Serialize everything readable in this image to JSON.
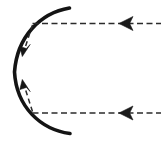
{
  "figure": {
    "canvas": {
      "width": 161,
      "height": 150,
      "background": "#ffffff"
    },
    "colors": {
      "stroke": "#1a1a1a",
      "arc_stroke": "#141414",
      "dash_stroke": "#2b2b2b",
      "background": "#ffffff"
    },
    "strokes": {
      "arc_width": 3.6,
      "dash_width": 1.6,
      "dash_pattern": "6 3.5"
    },
    "elements": [
      {
        "name": "mirror-arc",
        "kind": "arc",
        "description": "thick solid concave arc open toward the right",
        "path": "M 69.5 8 C 40 13 17 37 14.5 72 C 16.5 107 40.5 129.5 70 133.5",
        "top_endpoint": [
          69.5,
          8
        ],
        "bottom_endpoint": [
          70,
          133.5
        ],
        "leftmost_point": [
          14.5,
          72
        ]
      },
      {
        "name": "upper-incoming-ray",
        "kind": "dashed-line",
        "description": "upper horizontal dashed ray entering from right edge toward the arc",
        "y": 23.5,
        "x_start": 32.5,
        "x_end": 161
      },
      {
        "name": "lower-incoming-ray",
        "kind": "dashed-line",
        "description": "lower horizontal dashed ray entering from right edge toward the arc",
        "y": 113,
        "x_start": 32.5,
        "x_end": 161
      },
      {
        "name": "upper-ray-arrowhead",
        "kind": "arrowhead",
        "description": "left-pointing barbed dart on the upper horizontal ray",
        "tip": [
          119,
          23.5
        ],
        "base_x": 133,
        "half_height": 7
      },
      {
        "name": "lower-ray-arrowhead",
        "kind": "arrowhead",
        "description": "left-pointing barbed dart on the lower horizontal ray",
        "tip": [
          119,
          113
        ],
        "base_x": 133,
        "half_height": 7
      },
      {
        "name": "upper-diagonal-flow-arrow",
        "kind": "dashed-arrow",
        "description": "short dashed diagonal from the upper ray junction down-left to an arrowhead beside the arc",
        "path": "M 32.5 24.5 L 25 48",
        "arrow_tip": [
          23,
          56
        ],
        "arrow_direction": "down-left"
      },
      {
        "name": "lower-diagonal-flow-arrow",
        "kind": "dashed-arrow",
        "description": "short dashed diagonal from the lower ray junction up-left to an arrowhead beside the arc",
        "path": "M 32.5 112 L 25 88",
        "arrow_tip": [
          23,
          80
        ],
        "arrow_direction": "up-left"
      }
    ]
  }
}
